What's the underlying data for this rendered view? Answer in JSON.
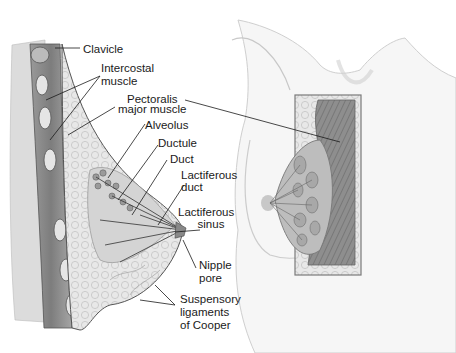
{
  "figure": {
    "type": "anatomical-illustration",
    "palette": {
      "background": "#ffffff",
      "line": "#2a2a2a",
      "tissue_light": "#e6e6e6",
      "tissue_mid": "#bdbdbd",
      "muscle": "#8a8a8a",
      "skin": "#f0f0f0"
    }
  },
  "labels": {
    "clavicle": "Clavicle",
    "intercostal_1": "Intercostal",
    "intercostal_2": "muscle",
    "pectoralis_1": "Pectoralis",
    "pectoralis_2": "major muscle",
    "alveolus": "Alveolus",
    "ductule": "Ductule",
    "duct": "Duct",
    "lactiferous_duct_1": "Lactiferous",
    "lactiferous_duct_2": "duct",
    "lactiferous_sinus_1": "Lactiferous",
    "lactiferous_sinus_2": "sinus",
    "nipple_pore_1": "Nipple",
    "nipple_pore_2": "pore",
    "cooper_1": "Suspensory",
    "cooper_2": "ligaments",
    "cooper_3": "of Cooper"
  }
}
